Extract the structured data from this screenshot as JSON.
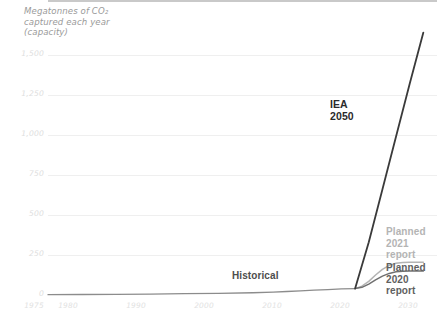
{
  "chart_data": {
    "type": "line",
    "title": "Megatonnes of CO₂\ncaptured each year\n(capacity)",
    "xlabel": "",
    "ylabel": "Megatonnes of CO2 captured each year (capacity)",
    "grid": true,
    "legend": "inline-annotations",
    "xlim": [
      1975,
      2032
    ],
    "ylim": [
      0,
      1600
    ],
    "yticks": [
      "0",
      "250",
      "500",
      "750",
      "1,000",
      "1,250",
      "1,500"
    ],
    "ytick_values": [
      0,
      250,
      500,
      750,
      1000,
      1250,
      1500
    ],
    "xticks": [
      "1975",
      "1980",
      "1990",
      "2000",
      "2010",
      "2020",
      "2030"
    ],
    "xtick_values": [
      1975,
      1980,
      1990,
      2000,
      2010,
      2020,
      2030
    ],
    "series": [
      {
        "name": "Historical",
        "color": "#8c8c8c",
        "x": [
          1975,
          1980,
          1985,
          1990,
          1995,
          2000,
          2005,
          2008,
          2010,
          2012,
          2014,
          2016,
          2018,
          2020
        ],
        "values": [
          2,
          3,
          4,
          6,
          8,
          10,
          14,
          18,
          22,
          26,
          30,
          34,
          38,
          40
        ]
      },
      {
        "name": "IEA 2050",
        "color": "#3a3a3a",
        "x": [
          2020,
          2022,
          2024,
          2026,
          2028,
          2030
        ],
        "values": [
          40,
          330,
          660,
          990,
          1320,
          1640
        ]
      },
      {
        "name": "Planned 2021 report",
        "color": "#b4b4b4",
        "x": [
          2020,
          2021,
          2022,
          2023,
          2024,
          2025,
          2026,
          2027,
          2028,
          2030
        ],
        "values": [
          40,
          55,
          85,
          125,
          160,
          185,
          198,
          203,
          205,
          205
        ]
      },
      {
        "name": "Planned 2020 report",
        "color": "#707070",
        "x": [
          2020,
          2021,
          2022,
          2023,
          2024,
          2025,
          2026,
          2027,
          2028,
          2030
        ],
        "values": [
          40,
          48,
          68,
          95,
          118,
          135,
          145,
          148,
          150,
          150
        ]
      }
    ],
    "annotations": [
      {
        "name": "historical",
        "text": "Historical",
        "color": "#4d4d4d"
      },
      {
        "name": "iea-2050",
        "text": "IEA\n2050",
        "color": "#2b2b2b"
      },
      {
        "name": "planned-2021",
        "text": "Planned\n2021\nreport",
        "color": "#b4b4b4"
      },
      {
        "name": "planned-2020",
        "text": "Planned\n2020\nreport",
        "color": "#606060"
      }
    ]
  }
}
